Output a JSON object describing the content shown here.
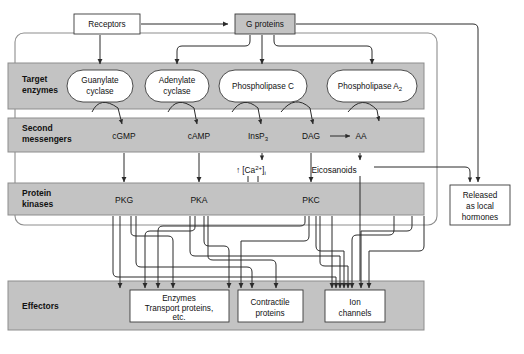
{
  "diagram": {
    "colors": {
      "band_fill": "#c3c3c3",
      "band_stroke": "#8d8d8d",
      "box_fill": "#ffffff",
      "gray_box_fill": "#c3c3c3",
      "line": "#2b2b2b",
      "text": "#111111"
    }
  },
  "top_nodes": [
    {
      "id": "receptors",
      "label": "Receptors",
      "style": "white-box",
      "x": 74,
      "y": 14,
      "w": 66,
      "h": 20
    },
    {
      "id": "g-proteins",
      "label": "G proteins",
      "style": "gray-box",
      "x": 235,
      "y": 14,
      "w": 60,
      "h": 20
    }
  ],
  "bands": [
    {
      "id": "target-enzymes",
      "label_line1": "Target",
      "label_line2": "enzymes",
      "y": 63,
      "h": 46,
      "nodes": [
        {
          "id": "guanylate-cyclase",
          "line1": "Guanylate",
          "line2": "cyclase",
          "cx": 100,
          "cy": 86,
          "rx": 33,
          "ry": 16
        },
        {
          "id": "adenylate-cyclase",
          "line1": "Adenylate",
          "line2": "cyclase",
          "cx": 177,
          "cy": 86,
          "rx": 32,
          "ry": 16
        },
        {
          "id": "phospholipase-c",
          "line1": "Phospholipase C",
          "line2": "",
          "cx": 263,
          "cy": 86,
          "rx": 44,
          "ry": 16
        },
        {
          "id": "phospholipase-a2",
          "line1": "Phospholipase A",
          "line2": "",
          "sub": "2",
          "cx": 372,
          "cy": 86,
          "rx": 45,
          "ry": 16
        }
      ]
    },
    {
      "id": "second-messengers",
      "label_line1": "Second",
      "label_line2": "messengers",
      "y": 118,
      "h": 34,
      "nodes": [
        {
          "id": "cgmp",
          "label": "cGMP",
          "x": 124,
          "y": 139
        },
        {
          "id": "camp",
          "label": "cAMP",
          "x": 199,
          "y": 139
        },
        {
          "id": "insp3",
          "label": "InsP",
          "sub": "3",
          "x": 262,
          "y": 139
        },
        {
          "id": "dag",
          "label": "DAG",
          "x": 311,
          "y": 139
        },
        {
          "id": "aa",
          "label": "AA",
          "x": 360,
          "y": 139
        }
      ]
    },
    {
      "id": "protein-kinases",
      "label_line1": "Protein",
      "label_line2": "kinases",
      "y": 183,
      "h": 32,
      "nodes": [
        {
          "id": "pkg",
          "label": "PKG",
          "x": 124,
          "y": 203
        },
        {
          "id": "pka",
          "label": "PKA",
          "x": 199,
          "y": 203
        },
        {
          "id": "pkc",
          "label": "PKC",
          "x": 311,
          "y": 203
        }
      ]
    },
    {
      "id": "effectors",
      "label_line1": "Effectors",
      "label_line2": "",
      "y": 281,
      "h": 49,
      "nodes": [
        {
          "id": "enzymes-transport",
          "line1": "Enzymes",
          "line2": "Transport proteins,",
          "line3": "etc.",
          "x": 130,
          "y": 290,
          "w": 99,
          "h": 32
        },
        {
          "id": "contractile-proteins",
          "line1": "Contractile",
          "line2": "proteins",
          "line3": "",
          "x": 238,
          "y": 290,
          "w": 65,
          "h": 32
        },
        {
          "id": "ion-channels",
          "line1": "Ion",
          "line2": "channels",
          "line3": "",
          "x": 325,
          "y": 290,
          "w": 60,
          "h": 32
        }
      ]
    }
  ],
  "annotations": [
    {
      "id": "calcium",
      "prefix": "↑",
      "bracket_open": "[",
      "ion": "Ca",
      "charge": "2+",
      "bracket_close": "]",
      "subscript": "i",
      "x": 236,
      "y": 170
    },
    {
      "id": "eicosanoids",
      "label": "Eicosanoids",
      "x": 334,
      "y": 170
    }
  ],
  "side_boxes": [
    {
      "id": "released-local-hormones",
      "line1": "Released",
      "line2": "as local",
      "line3": "hormones",
      "x": 450,
      "y": 185,
      "w": 60,
      "h": 40
    }
  ],
  "inline_arrows": [
    {
      "id": "dag-to-aa",
      "from": "dag",
      "to": "aa"
    }
  ]
}
